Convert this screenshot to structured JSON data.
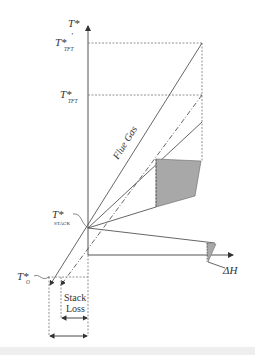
{
  "figure": {
    "y_axis_label": "T*",
    "x_axis_label": "ΔH",
    "labels": {
      "t_tft_prime": {
        "main": "T*",
        "prime": "'",
        "sub": "TFT"
      },
      "t_tft": {
        "main": "T*",
        "sub": "TFT"
      },
      "t_stack": {
        "main": "T*",
        "sub": "STACK"
      },
      "t_o": {
        "main": "T*",
        "sub": "O"
      }
    },
    "flue_gas_label": "Flue Gas",
    "stack_loss_label_line1": "Stack",
    "stack_loss_label_line2": "Loss"
  },
  "colors": {
    "line": "#555555",
    "dashed": "#777777",
    "shade": "#a8a8a8",
    "text": "#333333"
  }
}
